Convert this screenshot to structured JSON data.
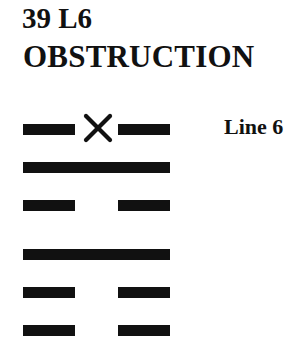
{
  "header": {
    "number_label": "39 L6",
    "hexagram_name": "OBSTRUCTION"
  },
  "hexagram": {
    "colors": {
      "ink": "#111111",
      "background": "#ffffff"
    },
    "lines_top_to_bottom": [
      {
        "position": 6,
        "type": "broken",
        "changing": true,
        "marker": "x-icon",
        "label": "Line 6"
      },
      {
        "position": 5,
        "type": "solid",
        "changing": false
      },
      {
        "position": 4,
        "type": "broken",
        "changing": false
      },
      {
        "position": 3,
        "type": "solid",
        "changing": false
      },
      {
        "position": 2,
        "type": "broken",
        "changing": false
      },
      {
        "position": 1,
        "type": "broken",
        "changing": false
      }
    ]
  },
  "annotation": {
    "line_label": "Line 6"
  }
}
